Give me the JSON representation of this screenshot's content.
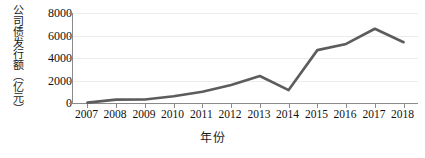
{
  "chart_data": {
    "type": "line",
    "title": "",
    "xlabel": "年份",
    "ylabel": "公司债发行额（亿元）",
    "ylabel_chars": [
      "公",
      "司",
      "债",
      "发",
      "行",
      "额",
      "（",
      "亿",
      "元",
      "）"
    ],
    "categories": [
      "2007",
      "2008",
      "2009",
      "2010",
      "2011",
      "2012",
      "2013",
      "2014",
      "2015",
      "2016",
      "2017",
      "2018"
    ],
    "values": [
      30,
      300,
      310,
      600,
      1000,
      1600,
      2400,
      1150,
      4700,
      5250,
      6600,
      5400
    ],
    "series": [
      {
        "name": "公司债发行额",
        "values": [
          30,
          300,
          310,
          600,
          1000,
          1600,
          2400,
          1150,
          4700,
          5250,
          6600,
          5400
        ]
      }
    ],
    "ylim": [
      0,
      8000
    ],
    "yticks": [
      0,
      2000,
      4000,
      6000,
      8000
    ],
    "ytick_labels": [
      "0",
      "2000",
      "4000",
      "6000",
      "8000"
    ],
    "xlim": [
      "2007",
      "2018"
    ],
    "grid": true,
    "grid_axis": "y",
    "legend": false,
    "legend_position": "none",
    "line_color": "#5c5c5c",
    "line_width": 2.6,
    "axis_color": "#8a8a8a",
    "grid_color": "#ececec",
    "background": "#ffffff",
    "text_color": "#111111"
  }
}
